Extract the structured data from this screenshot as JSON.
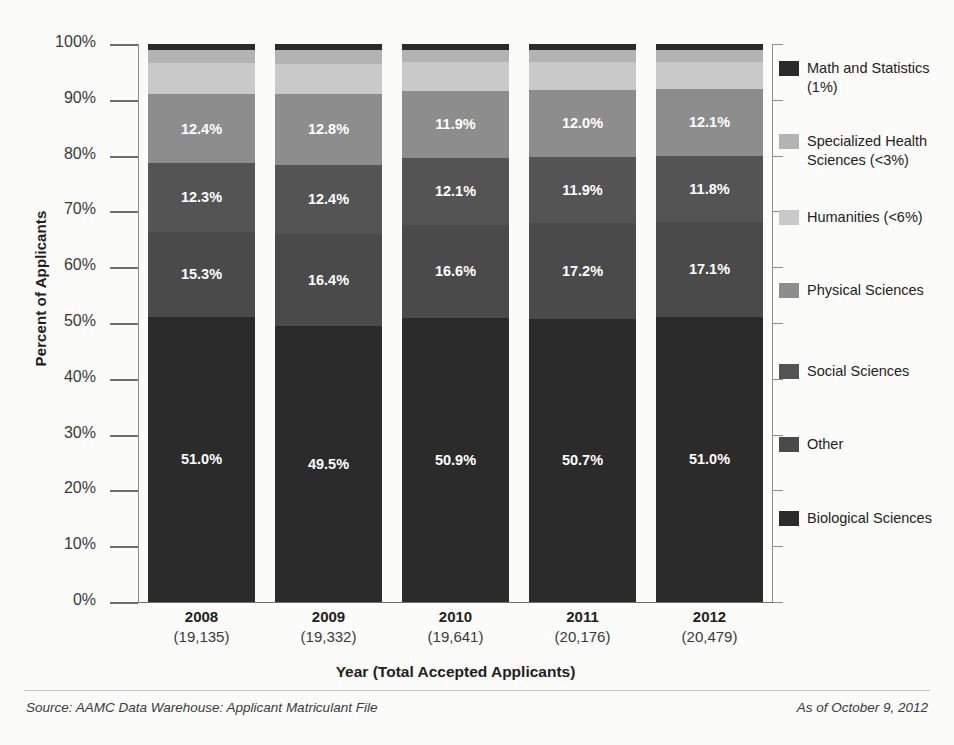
{
  "chart_data": {
    "type": "bar",
    "subtype": "stacked-percentage-column",
    "title": "",
    "xlabel": "Year (Total Accepted Applicants)",
    "ylabel": "Percent of Applicants",
    "ylim": [
      0,
      100
    ],
    "ytick_labels": [
      "100%",
      "90%",
      "80%",
      "70%",
      "60%",
      "50%",
      "40%",
      "30%",
      "20%",
      "10%",
      "0%"
    ],
    "ytick_values": [
      100,
      90,
      80,
      70,
      60,
      50,
      40,
      30,
      20,
      10,
      0
    ],
    "grid": false,
    "legend_position": "right",
    "categories": [
      "2008",
      "2009",
      "2010",
      "2011",
      "2012"
    ],
    "category_totals": [
      "(19,135)",
      "(19,332)",
      "(19,641)",
      "(20,176)",
      "(20,479)"
    ],
    "series": [
      {
        "name": "Biological Sciences",
        "color": "#2b2b2b",
        "values": [
          51.0,
          49.5,
          50.9,
          50.7,
          51.0
        ],
        "labels": [
          "51.0%",
          "49.5%",
          "50.9%",
          "50.7%",
          "51.0%"
        ],
        "show_labels": true
      },
      {
        "name": "Other",
        "color": "#4a4a4a",
        "values": [
          15.3,
          16.4,
          16.6,
          17.2,
          17.1
        ],
        "labels": [
          "15.3%",
          "16.4%",
          "16.6%",
          "17.2%",
          "17.1%"
        ],
        "show_labels": true
      },
      {
        "name": "Social Sciences",
        "color": "#545454",
        "values": [
          12.3,
          12.4,
          12.1,
          11.9,
          11.8
        ],
        "labels": [
          "12.3%",
          "12.4%",
          "12.1%",
          "11.9%",
          "11.8%"
        ],
        "show_labels": true
      },
      {
        "name": "Physical Sciences",
        "color": "#8d8d8d",
        "values": [
          12.4,
          12.8,
          11.9,
          12.0,
          12.1
        ],
        "labels": [
          "12.4%",
          "12.8%",
          "11.9%",
          "12.0%",
          "12.1%"
        ],
        "show_labels": true
      },
      {
        "name": "Humanities",
        "color": "#c9c9c9",
        "values": [
          5.6,
          5.3,
          5.2,
          5.0,
          4.8
        ],
        "labels": [
          "",
          "",
          "",
          "",
          ""
        ],
        "show_labels": false
      },
      {
        "name": "Specialized Health Sciences",
        "color": "#b3b3b3",
        "values": [
          2.4,
          2.6,
          2.3,
          2.2,
          2.2
        ],
        "labels": [
          "",
          "",
          "",
          "",
          ""
        ],
        "show_labels": false
      },
      {
        "name": "Math and Statistics",
        "color": "#2b2b2b",
        "values": [
          1.0,
          1.0,
          1.0,
          1.0,
          1.0
        ],
        "labels": [
          "",
          "",
          "",
          "",
          ""
        ],
        "show_labels": false
      }
    ]
  },
  "legend": {
    "items": [
      {
        "label": "Math and Statistics (1%)",
        "color": "#2b2b2b",
        "top": 15
      },
      {
        "label": "Specialized Health Sciences (<3%)",
        "color": "#b3b3b3",
        "top": 88
      },
      {
        "label": "Humanities (<6%)",
        "color": "#c9c9c9",
        "top": 164
      },
      {
        "label": "Physical Sciences",
        "color": "#8d8d8d",
        "top": 237
      },
      {
        "label": "Social Sciences",
        "color": "#545454",
        "top": 318
      },
      {
        "label": "Other",
        "color": "#4a4a4a",
        "top": 391
      },
      {
        "label": "Biological Sciences",
        "color": "#2b2b2b",
        "top": 465
      }
    ]
  },
  "footer": {
    "source": "Source: AAMC Data Warehouse: Applicant Matriculant File",
    "as_of": "As of October 9, 2012"
  }
}
